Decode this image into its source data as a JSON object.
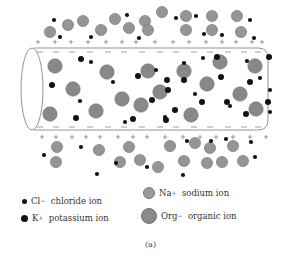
{
  "figure": {
    "caption": "(a)",
    "colors": {
      "membrane_outline": "#888888",
      "ion_dark": "#111111",
      "ion_gray_fill": "#959595",
      "ion_gray_stroke": "#707070",
      "charge_sign": "#777777"
    },
    "axon": {
      "left_x": 34,
      "right_x": 268,
      "top_y": 48,
      "bottom_y": 130,
      "end_cap_rx": 11
    },
    "charges": {
      "outside_top_plus_x": [
        38,
        55,
        71,
        88,
        106,
        122,
        136,
        155,
        173,
        189,
        206,
        222,
        236,
        252,
        262
      ],
      "outside_top_y": 42,
      "inside_top_minus_x": [
        40,
        56,
        72,
        90,
        108,
        124,
        142,
        160,
        176,
        194,
        210,
        228,
        244,
        258
      ],
      "inside_top_y": 52,
      "inside_bottom_minus_x": [
        40,
        56,
        72,
        90,
        108,
        124,
        142,
        160,
        176,
        194,
        210,
        228,
        244,
        258
      ],
      "inside_bottom_y": 127,
      "outside_bottom_plus_x": [
        42,
        56,
        72,
        86,
        100,
        118,
        133,
        147,
        165,
        183,
        200,
        216,
        233,
        250,
        266
      ],
      "outside_bottom_y": 137
    },
    "ions": {
      "sodium": [
        [
          50,
          32
        ],
        [
          68,
          25
        ],
        [
          83,
          21
        ],
        [
          101,
          30
        ],
        [
          115,
          19
        ],
        [
          129,
          28
        ],
        [
          145,
          21
        ],
        [
          148,
          30
        ],
        [
          162,
          12
        ],
        [
          186,
          16
        ],
        [
          186,
          30
        ],
        [
          212,
          16
        ],
        [
          212,
          30
        ],
        [
          237,
          16
        ],
        [
          241,
          32
        ],
        [
          57,
          147
        ],
        [
          99,
          150
        ],
        [
          129,
          147
        ],
        [
          140,
          160
        ],
        [
          120,
          162
        ],
        [
          56,
          162
        ],
        [
          170,
          146
        ],
        [
          195,
          143
        ],
        [
          210,
          148
        ],
        [
          233,
          146
        ],
        [
          184,
          161
        ],
        [
          207,
          163
        ],
        [
          222,
          162
        ],
        [
          243,
          161
        ],
        [
          158,
          167
        ]
      ],
      "organic": [
        [
          55,
          66
        ],
        [
          107,
          72
        ],
        [
          148,
          71
        ],
        [
          184,
          71
        ],
        [
          220,
          62
        ],
        [
          255,
          66
        ],
        [
          73,
          89
        ],
        [
          122,
          99
        ],
        [
          160,
          92
        ],
        [
          207,
          84
        ],
        [
          240,
          94
        ],
        [
          50,
          114
        ],
        [
          96,
          111
        ],
        [
          141,
          105
        ],
        [
          191,
          115
        ],
        [
          256,
          109
        ]
      ],
      "chloride": [
        [
          54,
          20
        ],
        [
          60,
          37
        ],
        [
          91,
          37
        ],
        [
          127,
          15
        ],
        [
          139,
          38
        ],
        [
          176,
          18
        ],
        [
          196,
          16
        ],
        [
          204,
          34
        ],
        [
          222,
          35
        ],
        [
          250,
          20
        ],
        [
          254,
          38
        ],
        [
          91,
          62
        ],
        [
          113,
          82
        ],
        [
          156,
          70
        ],
        [
          184,
          63
        ],
        [
          203,
          58
        ],
        [
          195,
          94
        ],
        [
          230,
          106
        ],
        [
          247,
          61
        ],
        [
          260,
          78
        ],
        [
          270,
          90
        ],
        [
          270,
          112
        ],
        [
          80,
          101
        ],
        [
          125,
          122
        ],
        [
          165,
          117
        ],
        [
          44,
          155
        ],
        [
          81,
          147
        ],
        [
          97,
          174
        ],
        [
          116,
          163
        ],
        [
          147,
          167
        ],
        [
          183,
          175
        ],
        [
          187,
          141
        ],
        [
          211,
          141
        ],
        [
          226,
          139
        ],
        [
          251,
          142
        ],
        [
          255,
          157
        ]
      ],
      "potassium": [
        [
          81,
          59
        ],
        [
          52,
          85
        ],
        [
          76,
          118
        ],
        [
          138,
          76
        ],
        [
          167,
          80
        ],
        [
          133,
          119
        ],
        [
          184,
          80
        ],
        [
          168,
          90
        ],
        [
          152,
          100
        ],
        [
          166,
          120
        ],
        [
          175,
          110
        ],
        [
          202,
          102
        ],
        [
          217,
          57
        ],
        [
          221,
          77
        ],
        [
          227,
          102
        ],
        [
          250,
          82
        ],
        [
          246,
          114
        ],
        [
          269,
          57
        ],
        [
          268,
          102
        ]
      ]
    },
    "legend": [
      {
        "id": "chloride",
        "symbol": "Cl",
        "charge": "−",
        "name": "chloride ion"
      },
      {
        "id": "potassium",
        "symbol": "K",
        "charge": "+",
        "name": "potassium ion"
      },
      {
        "id": "sodium",
        "symbol": "Na",
        "charge": "+",
        "name": "sodium ion"
      },
      {
        "id": "organic",
        "symbol": "Org",
        "charge": "−",
        "name": "organic ion"
      }
    ]
  }
}
